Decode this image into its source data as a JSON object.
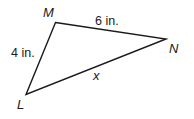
{
  "diagram": {
    "type": "triangle",
    "stroke_color": "#1a1a1a",
    "vertices": [
      {
        "name": "M",
        "label": "M"
      },
      {
        "name": "N",
        "label": "N"
      },
      {
        "name": "L",
        "label": "L"
      }
    ],
    "sides": [
      {
        "between": "M-N",
        "label": "6 in."
      },
      {
        "between": "M-L",
        "label": "4 in."
      },
      {
        "between": "L-N",
        "label": "x"
      }
    ]
  }
}
